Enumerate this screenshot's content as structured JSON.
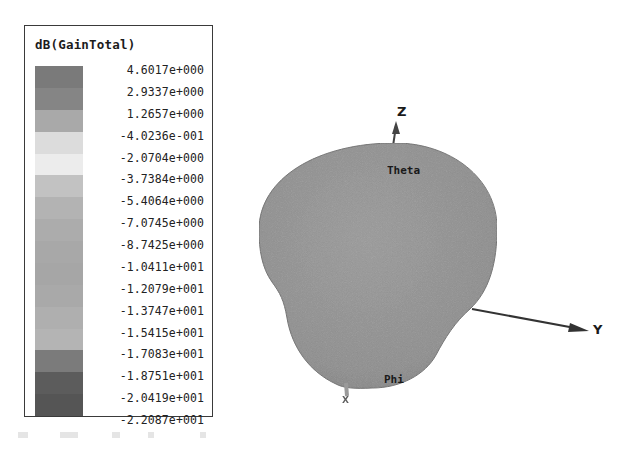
{
  "chart_data": {
    "type": "heatmap",
    "title": "dB(GainTotal)",
    "subtype": "3d-radiation-pattern",
    "legend": {
      "title": "dB(GainTotal)",
      "placement": "top-left",
      "levels": [
        {
          "value": "4.6017e+000",
          "color": "#7a7a7a"
        },
        {
          "value": "2.9337e+000",
          "color": "#858585"
        },
        {
          "value": "1.2657e+000",
          "color": "#a9a9a9"
        },
        {
          "value": "-4.0236e-001",
          "color": "#dcdcdc"
        },
        {
          "value": "-2.0704e+000",
          "color": "#ececec"
        },
        {
          "value": "-3.7384e+000",
          "color": "#c2c2c2"
        },
        {
          "value": "-5.4064e+000",
          "color": "#b3b3b3"
        },
        {
          "value": "-7.0745e+000",
          "color": "#acacac"
        },
        {
          "value": "-8.7425e+000",
          "color": "#a8a8a8"
        },
        {
          "value": "-1.0411e+001",
          "color": "#a6a6a6"
        },
        {
          "value": "-1.2079e+001",
          "color": "#a9a9a9"
        },
        {
          "value": "-1.3747e+001",
          "color": "#afafaf"
        },
        {
          "value": "-1.5415e+001",
          "color": "#b4b4b4"
        },
        {
          "value": "-1.7083e+001",
          "color": "#7b7b7b"
        },
        {
          "value": "-1.8751e+001",
          "color": "#5c5c5c"
        },
        {
          "value": "-2.0419e+001",
          "color": "#555555"
        },
        {
          "value": "-2.2087e+001",
          "color": "#555555"
        }
      ],
      "range": [
        -22.087,
        4.6017
      ],
      "unit": "dB"
    },
    "axes": {
      "x_label": "X",
      "y_label": "Y",
      "z_label": "Z"
    },
    "surface_labels": [
      "Theta",
      "Phi"
    ],
    "surface_color": "#8f8f8f"
  }
}
